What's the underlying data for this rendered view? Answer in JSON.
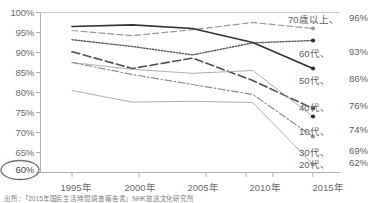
{
  "chart_data": {
    "type": "line",
    "title": "",
    "subtitle": "",
    "xlabel": "",
    "ylabel": "",
    "x": [
      "1995年",
      "2000年",
      "2005年",
      "2010年",
      "2015年"
    ],
    "ylim": [
      60,
      100
    ],
    "ytick_values": [
      60,
      65,
      70,
      75,
      80,
      85,
      90,
      95,
      100
    ],
    "ytick_labels": [
      "60%",
      "65%",
      "70%",
      "75%",
      "80%",
      "85%",
      "90%",
      "95%",
      "100%"
    ],
    "grid": false,
    "legend_position": "right-inline",
    "series": [
      {
        "name": "70歳以上",
        "end_label": "70歳以上、",
        "end_value_label": "96%",
        "values": [
          95.5,
          94.2,
          95.7,
          97.5,
          96.0
        ],
        "style": "dashed",
        "color": "#9a9a9a",
        "marker": "circle"
      },
      {
        "name": "60代",
        "end_label": "60代、",
        "end_value_label": "93%",
        "values": [
          93.2,
          91.5,
          89.4,
          92.4,
          93.0
        ],
        "style": "dotted",
        "color": "#5a5a5a",
        "marker": "circle-filled"
      },
      {
        "name": "50代",
        "end_label": "50代、",
        "end_value_label": "86%",
        "values": [
          96.5,
          96.9,
          96.0,
          92.5,
          86.0
        ],
        "style": "solid",
        "color": "#333333",
        "marker": "circle-filled"
      },
      {
        "name": "40代",
        "end_label": "40代、",
        "end_value_label": "76%",
        "values": [
          90.2,
          86.0,
          88.6,
          83.0,
          76.0
        ],
        "style": "long-dash",
        "color": "#4f4f4f",
        "marker": "circle"
      },
      {
        "name": "10代",
        "end_label": "10代、",
        "end_value_label": "74%",
        "values": [
          87.5,
          85.8,
          84.8,
          85.5,
          74.0
        ],
        "style": "solid-thin",
        "color": "#a5a5a5",
        "marker": "circle-filled"
      },
      {
        "name": "30代",
        "end_label": "30代、",
        "end_value_label": "69%",
        "values": [
          87.5,
          84.5,
          82.0,
          79.5,
          69.0
        ],
        "style": "dash-dot",
        "color": "#8d8d8d",
        "marker": "circle"
      },
      {
        "name": "20代",
        "end_label": "20代、",
        "end_value_label": "62%",
        "values": [
          80.5,
          77.6,
          77.8,
          77.5,
          62.0
        ],
        "style": "solid-thin",
        "color": "#a5a5a5",
        "marker": "circle"
      }
    ],
    "highlighted_ytick": "60%",
    "source_note": "出所：「2015年国民生活時間調査報告書」NHK放送文化研究所"
  }
}
